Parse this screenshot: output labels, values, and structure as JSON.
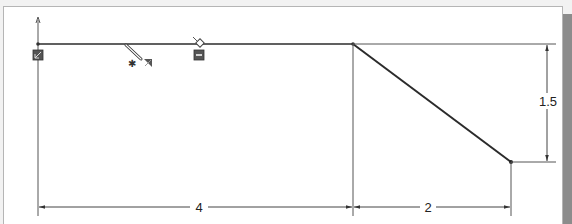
{
  "viewport": {
    "type": "cad-sketch",
    "background": "#ffffff"
  },
  "sketch": {
    "entities": [
      {
        "id": "top-line",
        "kind": "line",
        "role": "horizontal"
      },
      {
        "id": "slope-line",
        "kind": "line",
        "role": "angled"
      },
      {
        "id": "origin-vertical",
        "kind": "construction-line",
        "role": "vertical"
      }
    ],
    "relations_icons": [
      {
        "name": "fix-relation-icon",
        "desc": "fixed / coincident marker at origin"
      },
      {
        "name": "pencil-sketch-cursor-icon",
        "desc": "line tool cursor"
      },
      {
        "name": "horizontal-relation-icon",
        "desc": "horizontal relation marker"
      }
    ]
  },
  "dimensions": {
    "horizontal_1": {
      "label": "4",
      "value": 4
    },
    "horizontal_2": {
      "label": "2",
      "value": 2
    },
    "vertical_1": {
      "label": "1.5",
      "value": 1.5
    }
  },
  "colors": {
    "line": "#2b2b2b",
    "dimension": "#333333",
    "icon": "#555555",
    "side_strip": "#8c8c8c"
  }
}
